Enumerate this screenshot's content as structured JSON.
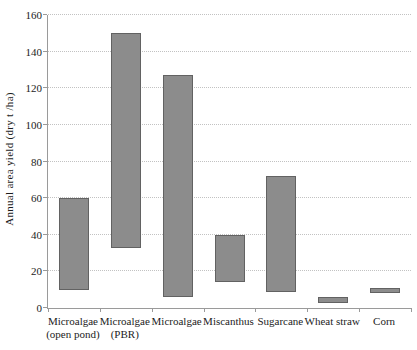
{
  "chart_data": {
    "type": "bar",
    "subtype": "floating-range-columns",
    "title": "",
    "xlabel": "",
    "ylabel": "Annual area yield (dry t /ha)",
    "ylim": [
      0,
      160
    ],
    "ytick_step": 20,
    "grid": "horizontal-dotted",
    "legend": "none",
    "categories": [
      "Microalgae (open pond)",
      "Microalgae (PBR)",
      "Microalgae",
      "Miscanthus",
      "Sugarcane",
      "Wheat straw",
      "Corn"
    ],
    "category_label_lines": [
      [
        "Microalgae",
        "(open pond)"
      ],
      [
        "Microalgae",
        "(PBR)"
      ],
      [
        "Microalgae"
      ],
      [
        "Miscanthus"
      ],
      [
        "Sugarcane"
      ],
      [
        "Wheat straw"
      ],
      [
        "Corn"
      ]
    ],
    "series": [
      {
        "name": "yield range low (dry t/ha)",
        "values": [
          10,
          33,
          6,
          14,
          9,
          3,
          8
        ]
      },
      {
        "name": "yield range high (dry t/ha)",
        "values": [
          60,
          150,
          127,
          40,
          72,
          6,
          11
        ]
      }
    ],
    "colors": {
      "bar_fill": "#8c8c8c",
      "bar_border": "#626262",
      "axis": "#9a9a9a",
      "gridline": "#c2c2c2",
      "text": "#1c1c1c"
    }
  }
}
